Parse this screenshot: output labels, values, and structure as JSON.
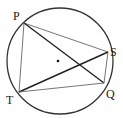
{
  "diagram": {
    "type": "circle-geometry",
    "circle": {
      "cx": 60,
      "cy": 61,
      "r": 53,
      "color": "#333333"
    },
    "center_dot": {
      "x": 58,
      "y": 61
    },
    "points": {
      "P": {
        "label": "P",
        "x": 24,
        "y": 23
      },
      "S": {
        "label": "S",
        "x": 108,
        "y": 52
      },
      "Q": {
        "label": "Q",
        "x": 104,
        "y": 83
      },
      "T": {
        "label": "T",
        "x": 19,
        "y": 92
      }
    },
    "segments": [
      {
        "from": "P",
        "to": "S",
        "weight": "thin"
      },
      {
        "from": "P",
        "to": "Q",
        "weight": "thick"
      },
      {
        "from": "P",
        "to": "T",
        "weight": "thin"
      },
      {
        "from": "T",
        "to": "S",
        "weight": "thick"
      },
      {
        "from": "T",
        "to": "Q",
        "weight": "thin"
      },
      {
        "from": "S",
        "to": "Q",
        "weight": "thin"
      }
    ]
  }
}
